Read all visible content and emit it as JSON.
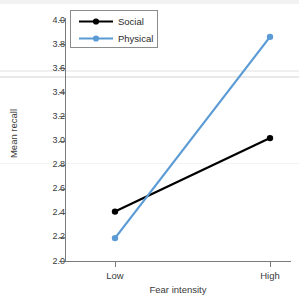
{
  "chart_data": {
    "type": "line",
    "title": "",
    "xlabel": "Fear intensity",
    "ylabel": "Mean recall",
    "categories": [
      "Low",
      "High"
    ],
    "ylim": [
      2.0,
      4.0
    ],
    "ytick_labels": [
      "2.0",
      "2.2",
      "2.4",
      "2.6",
      "2.8",
      "3.0",
      "3.2",
      "3.4",
      "3.6",
      "3.8",
      "4.0"
    ],
    "ytick_values": [
      2.0,
      2.2,
      2.4,
      2.6,
      2.8,
      3.0,
      3.2,
      3.4,
      3.6,
      3.8,
      4.0
    ],
    "grid": false,
    "legend_position": "top-left",
    "series": [
      {
        "name": "Social",
        "color": "#000000",
        "values": [
          2.41,
          3.02
        ]
      },
      {
        "name": "Physical",
        "color": "#5B9BD5",
        "values": [
          2.19,
          3.86
        ]
      }
    ]
  },
  "legend": {
    "items": [
      {
        "label": "Social"
      },
      {
        "label": "Physical"
      }
    ]
  },
  "axes": {
    "x_title": "Fear intensity",
    "y_title": "Mean recall",
    "x_categories": [
      "Low",
      "High"
    ],
    "y_labels": [
      "4.0",
      "3.8",
      "3.6",
      "3.4",
      "3.2",
      "3.0",
      "2.8",
      "2.6",
      "2.4",
      "2.2",
      "2.0"
    ]
  }
}
